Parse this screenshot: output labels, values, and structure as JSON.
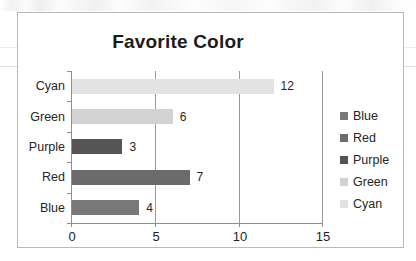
{
  "chart_data": {
    "type": "bar",
    "orientation": "horizontal",
    "title": "Favorite Color",
    "xlabel": "",
    "ylabel": "",
    "categories": [
      "Blue",
      "Red",
      "Purple",
      "Green",
      "Cyan"
    ],
    "values": [
      4,
      7,
      3,
      6,
      12
    ],
    "display_order_top_to_bottom": [
      "Cyan",
      "Green",
      "Purple",
      "Red",
      "Blue"
    ],
    "bars": [
      {
        "category": "Cyan",
        "value": 12,
        "value_label": "12",
        "color": "#e3e3e3"
      },
      {
        "category": "Green",
        "value": 6,
        "value_label": "6",
        "color": "#d2d2d2"
      },
      {
        "category": "Purple",
        "value": 3,
        "value_label": "3",
        "color": "#555555"
      },
      {
        "category": "Red",
        "value": 7,
        "value_label": "7",
        "color": "#6b6b6b"
      },
      {
        "category": "Blue",
        "value": 4,
        "value_label": "4",
        "color": "#787878"
      }
    ],
    "xlim": [
      0,
      15
    ],
    "xticks": [
      0,
      5,
      10,
      15
    ],
    "xtick_labels": [
      "0",
      "5",
      "10",
      "15"
    ],
    "grid": true,
    "grid_axis": "x",
    "legend_position": "right",
    "legend": [
      {
        "label": "Blue",
        "color": "#787878"
      },
      {
        "label": "Red",
        "color": "#6b6b6b"
      },
      {
        "label": "Purple",
        "color": "#555555"
      },
      {
        "label": "Green",
        "color": "#d2d2d2"
      },
      {
        "label": "Cyan",
        "color": "#e3e3e3"
      }
    ]
  }
}
